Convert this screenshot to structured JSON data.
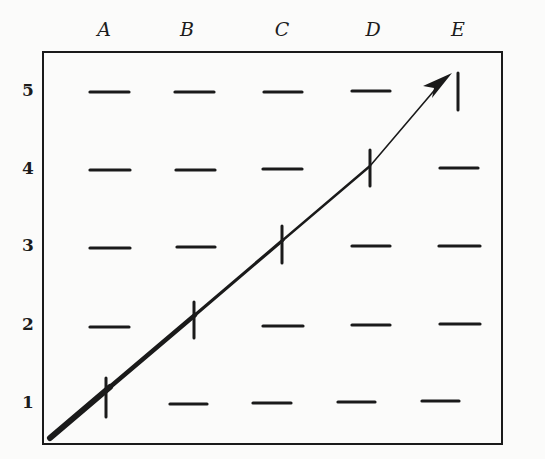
{
  "figure": {
    "columns": [
      {
        "label": "A",
        "x": 110
      },
      {
        "label": "B",
        "x": 196
      },
      {
        "label": "C",
        "x": 282
      },
      {
        "label": "D",
        "x": 370
      },
      {
        "label": "E",
        "x": 458
      }
    ],
    "rows": [
      {
        "label": "5",
        "y": 92
      },
      {
        "label": "4",
        "y": 170
      },
      {
        "label": "3",
        "y": 247
      },
      {
        "label": "2",
        "y": 326
      },
      {
        "label": "1",
        "y": 404
      }
    ],
    "frame": {
      "left": 43,
      "top": 52,
      "right": 502,
      "bottom": 444
    },
    "marks": {
      "horizontal": [
        "A5",
        "B5",
        "C5",
        "D5",
        "A4",
        "B4",
        "C4",
        "E4",
        "A3",
        "B3",
        "D3",
        "E3",
        "A2",
        "C2",
        "D2",
        "E2",
        "B1",
        "C1",
        "D1",
        "E1"
      ],
      "vertical": [
        "A1",
        "B2",
        "C3",
        "D4",
        "E5"
      ]
    },
    "arrow": {
      "from": [
        50,
        438
      ],
      "to": [
        447,
        76
      ],
      "description": "diagonal path from lower-left corner through A1, B2, C3, D4 to E5"
    },
    "colors": {
      "ink": "#1a1a1a",
      "paper": "#fbfbfa"
    }
  }
}
